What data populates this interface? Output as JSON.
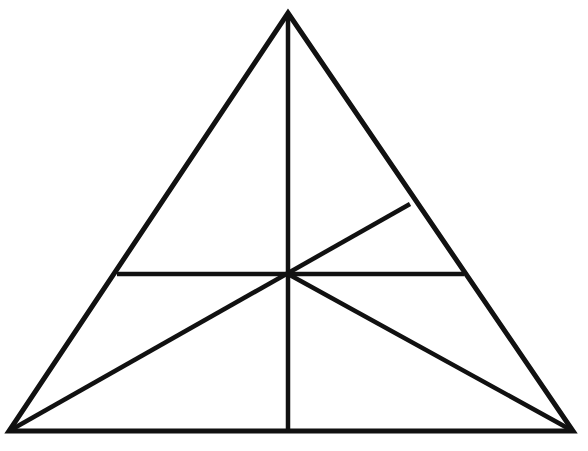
{
  "figure": {
    "title": "Equilateral triangle with internal cevians and midline",
    "type": "geometric-line-diagram",
    "canvas": {
      "width": 588,
      "height": 451
    },
    "background_color": "#ffffff",
    "stroke_color": "#111111",
    "outline_stroke_width": 5,
    "inner_stroke_width": 4.5,
    "points": {
      "apex": {
        "label": "apex",
        "x": 288,
        "y": 13
      },
      "bottom_left": {
        "label": "bottom-left",
        "x": 9,
        "y": 431
      },
      "bottom_right": {
        "label": "bottom-right",
        "x": 573,
        "y": 431
      },
      "center": {
        "label": "center",
        "x": 288,
        "y": 274
      },
      "base_midpoint": {
        "label": "base-midpoint",
        "x": 288,
        "y": 431
      },
      "left_midpoint": {
        "label": "left-side-point",
        "x": 117,
        "y": 274
      },
      "right_midpoint": {
        "label": "right-side-point",
        "x": 464,
        "y": 274
      },
      "right_upper": {
        "label": "right-side-upper",
        "x": 410,
        "y": 204
      }
    },
    "shapes": [
      {
        "name": "triangle-outline",
        "kind": "polygon",
        "points": "288,13 573,431 9,431",
        "stroke_width": 5
      }
    ],
    "segments": [
      {
        "name": "vertical-altitude",
        "description": "Vertical line from apex to base midpoint",
        "x1": 288,
        "y1": 13,
        "x2": 288,
        "y2": 431,
        "stroke_width": 4.5
      },
      {
        "name": "horizontal-midline",
        "description": "Horizontal line from left side to right side through center",
        "x1": 117,
        "y1": 274,
        "x2": 464,
        "y2": 274,
        "stroke_width": 4.5
      },
      {
        "name": "cevian-bottom-left-to-right-side",
        "description": "Line from bottom-left vertex through center up to right side",
        "x1": 9,
        "y1": 431,
        "x2": 410,
        "y2": 204,
        "stroke_width": 4.5
      },
      {
        "name": "cevian-center-to-bottom-right",
        "description": "Line from center down to bottom-right vertex",
        "x1": 288,
        "y1": 274,
        "x2": 573,
        "y2": 431,
        "stroke_width": 4.5
      }
    ]
  }
}
